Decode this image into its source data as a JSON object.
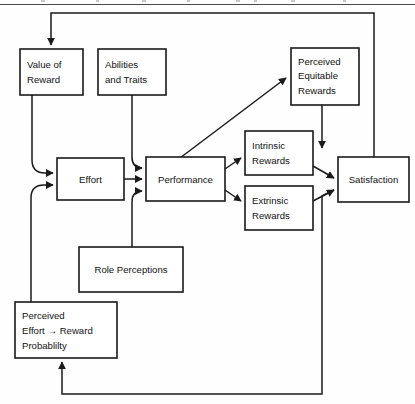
{
  "diagram": {
    "type": "flowchart",
    "background_color": "#ffffff",
    "line_color": "#1a1a1a",
    "text_color": "#111111",
    "nodes": [
      {
        "id": "value-of-reward",
        "lines": [
          "Value of",
          "Reward"
        ],
        "align": "left",
        "x": 20,
        "y": 49,
        "w": 63,
        "h": 46
      },
      {
        "id": "abilities-and-traits",
        "lines": [
          "Abilities",
          "and Traits"
        ],
        "align": "left",
        "x": 98,
        "y": 49,
        "w": 68,
        "h": 46
      },
      {
        "id": "perceived-equitable-rewards",
        "lines": [
          "Perceived",
          "Equitable",
          "Rewards"
        ],
        "align": "left",
        "x": 291,
        "y": 48,
        "w": 68,
        "h": 57
      },
      {
        "id": "effort",
        "lines": [
          "Effort"
        ],
        "align": "center",
        "x": 57,
        "y": 158,
        "w": 67,
        "h": 42
      },
      {
        "id": "performance",
        "lines": [
          "Performance"
        ],
        "align": "center",
        "x": 146,
        "y": 157,
        "w": 79,
        "h": 44
      },
      {
        "id": "intrinsic-rewards",
        "lines": [
          "Intrinsic",
          "Rewards"
        ],
        "align": "left",
        "x": 245,
        "y": 131,
        "w": 68,
        "h": 44
      },
      {
        "id": "extrinsic-rewards",
        "lines": [
          "Extrinsic",
          "Rewards"
        ],
        "align": "left",
        "x": 245,
        "y": 186,
        "w": 68,
        "h": 44
      },
      {
        "id": "satisfaction",
        "lines": [
          "Satisfaction"
        ],
        "align": "center",
        "x": 338,
        "y": 157,
        "w": 71,
        "h": 45
      },
      {
        "id": "role-perceptions",
        "lines": [
          "Role Perceptions"
        ],
        "align": "center",
        "x": 79,
        "y": 247,
        "w": 104,
        "h": 45
      },
      {
        "id": "perceived-effort-reward-probability",
        "lines": [
          "Perceived",
          "Effort → Reward",
          "Probablilty"
        ],
        "align": "left",
        "x": 15,
        "y": 302,
        "w": 102,
        "h": 56
      }
    ],
    "edges": [
      {
        "id": "satisfaction-to-value-of-reward",
        "from": "satisfaction",
        "to": "value-of-reward",
        "label": ""
      },
      {
        "id": "value-of-reward-to-effort",
        "from": "value-of-reward",
        "to": "effort",
        "label": ""
      },
      {
        "id": "probability-to-effort",
        "from": "perceived-effort-reward-probability",
        "to": "effort",
        "label": ""
      },
      {
        "id": "effort-to-performance",
        "from": "effort",
        "to": "performance",
        "label": ""
      },
      {
        "id": "abilities-to-performance",
        "from": "abilities-and-traits",
        "to": "performance",
        "label": ""
      },
      {
        "id": "role-perceptions-to-performance",
        "from": "role-perceptions",
        "to": "performance",
        "label": ""
      },
      {
        "id": "performance-to-perceived-equitable-rewards",
        "from": "performance",
        "to": "perceived-equitable-rewards",
        "label": ""
      },
      {
        "id": "performance-to-intrinsic-rewards",
        "from": "performance",
        "to": "intrinsic-rewards",
        "label": ""
      },
      {
        "id": "performance-to-extrinsic-rewards",
        "from": "performance",
        "to": "extrinsic-rewards",
        "label": ""
      },
      {
        "id": "intrinsic-rewards-to-satisfaction",
        "from": "intrinsic-rewards",
        "to": "satisfaction",
        "label": ""
      },
      {
        "id": "extrinsic-rewards-to-satisfaction",
        "from": "extrinsic-rewards",
        "to": "satisfaction",
        "label": ""
      },
      {
        "id": "perceived-equitable-rewards-to-satisfaction",
        "from": "perceived-equitable-rewards",
        "to": "satisfaction",
        "label": ""
      },
      {
        "id": "satisfaction-to-probability",
        "from": "satisfaction",
        "to": "perceived-effort-reward-probability",
        "label": ""
      }
    ]
  }
}
